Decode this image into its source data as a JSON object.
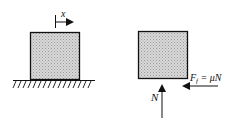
{
  "diagram": {
    "left_panel": {
      "displacement_label": "x",
      "description": "block on hatched ground with displacement arrow"
    },
    "right_panel": {
      "normal_force_label": "N",
      "friction_label_main": "F",
      "friction_label_sub": "f",
      "friction_label_rest": " = μN",
      "description": "free body diagram with normal force and friction force"
    },
    "colors": {
      "block_fill": "#c8c8c8",
      "stroke": "#111111"
    }
  }
}
